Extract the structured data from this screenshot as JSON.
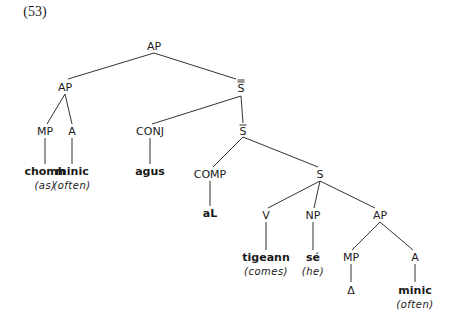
{
  "example_number": "(53)",
  "tree": {
    "root": {
      "label": "AP"
    },
    "ap_left": {
      "label": "AP"
    },
    "s_double_bar": {
      "label": "S",
      "bars": "double"
    },
    "mp_left": {
      "label": "MP"
    },
    "a_left": {
      "label": "A"
    },
    "conj": {
      "label": "CONJ"
    },
    "s_bar": {
      "label": "S",
      "bars": "single"
    },
    "comp": {
      "label": "COMP"
    },
    "s": {
      "label": "S"
    },
    "v": {
      "label": "V"
    },
    "np": {
      "label": "NP"
    },
    "ap_right": {
      "label": "AP"
    },
    "mp_right": {
      "label": "MP"
    },
    "a_right": {
      "label": "A"
    }
  },
  "leaves": {
    "chomh": {
      "word": "chomh",
      "gloss": "(as)"
    },
    "minic_left": {
      "word": "minic",
      "gloss": "(often)"
    },
    "agus": {
      "word": "agus"
    },
    "aL": {
      "word": "aL"
    },
    "tigeann": {
      "word": "tigeann",
      "gloss": "(comes)"
    },
    "se": {
      "word": "sé",
      "gloss": "(he)"
    },
    "delta": {
      "word": "Δ"
    },
    "minic_right": {
      "word": "minic",
      "gloss": "(often)"
    }
  },
  "colors": {
    "ink": "#1a1a1a",
    "background": "#ffffff"
  }
}
